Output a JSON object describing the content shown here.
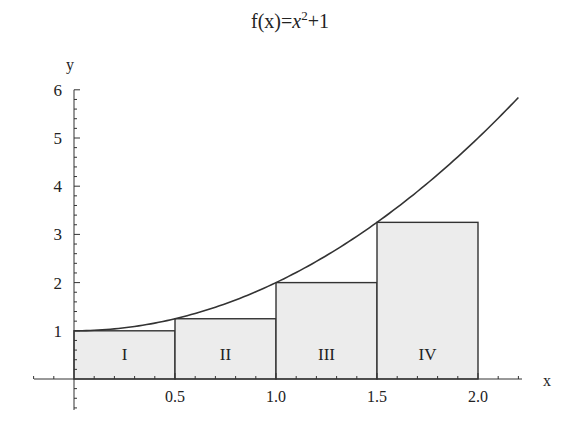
{
  "chart_data": {
    "type": "area",
    "title_parts": {
      "prefix": "f(x)=",
      "var": "x",
      "exp": "2",
      "suffix": "+1"
    },
    "xlabel": "x",
    "ylabel": "y",
    "xlim": [
      -0.2,
      2.2
    ],
    "ylim": [
      0,
      6
    ],
    "x_ticks": [
      "0.5",
      "1.0",
      "1.5",
      "2.0"
    ],
    "x_tick_values": [
      0.5,
      1.0,
      1.5,
      2.0
    ],
    "y_ticks": [
      "1",
      "2",
      "3",
      "4",
      "5",
      "6"
    ],
    "y_tick_values": [
      1,
      2,
      3,
      4,
      5,
      6
    ],
    "grid": false,
    "series": [
      {
        "name": "f(x)=x^2+1",
        "kind": "line",
        "x": [
          0,
          0.25,
          0.5,
          0.75,
          1.0,
          1.25,
          1.5,
          1.75,
          2.0,
          2.2
        ],
        "values": [
          1,
          1.0625,
          1.25,
          1.5625,
          2,
          2.5625,
          3.25,
          4.0625,
          5,
          5.84
        ]
      },
      {
        "name": "Left Riemann rectangles",
        "kind": "bar",
        "categories": [
          "I",
          "II",
          "III",
          "IV"
        ],
        "x_left": [
          0,
          0.5,
          1.0,
          1.5
        ],
        "x_right": [
          0.5,
          1.0,
          1.5,
          2.0
        ],
        "values": [
          1,
          1.25,
          2,
          3.25
        ]
      }
    ],
    "colors": {
      "line": "#333333",
      "fill": "#ececec",
      "text": "#222222"
    }
  }
}
